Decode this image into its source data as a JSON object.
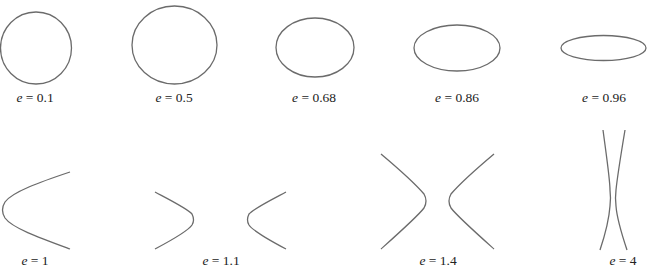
{
  "figure": {
    "stroke_color": "#6b6b6b",
    "text_color": "#222222",
    "rows": [
      {
        "name": "ellipses",
        "items": [
          {
            "type": "circle",
            "variable": "e",
            "equals": " = ",
            "value": "0.1",
            "label": "e = 0.1"
          },
          {
            "type": "ellipse",
            "variable": "e",
            "equals": " = ",
            "value": "0.5",
            "label": "e = 0.5"
          },
          {
            "type": "ellipse",
            "variable": "e",
            "equals": " = ",
            "value": "0.68",
            "label": "e = 0.68"
          },
          {
            "type": "ellipse",
            "variable": "e",
            "equals": " = ",
            "value": "0.86",
            "label": "e = 0.86"
          },
          {
            "type": "ellipse",
            "variable": "e",
            "equals": " = ",
            "value": "0.96",
            "label": "e = 0.96"
          }
        ]
      },
      {
        "name": "parabola-and-hyperbolas",
        "items": [
          {
            "type": "parabola",
            "variable": "e",
            "equals": " = ",
            "value": "1",
            "label": "e = 1"
          },
          {
            "type": "hyperbola",
            "variable": "e",
            "equals": " = ",
            "value": "1.1",
            "label": "e = 1.1"
          },
          {
            "type": "hyperbola",
            "variable": "e",
            "equals": " = ",
            "value": "1.4",
            "label": "e = 1.4"
          },
          {
            "type": "hyperbola",
            "variable": "e",
            "equals": " = ",
            "value": "4",
            "label": "e = 4"
          }
        ]
      }
    ]
  }
}
